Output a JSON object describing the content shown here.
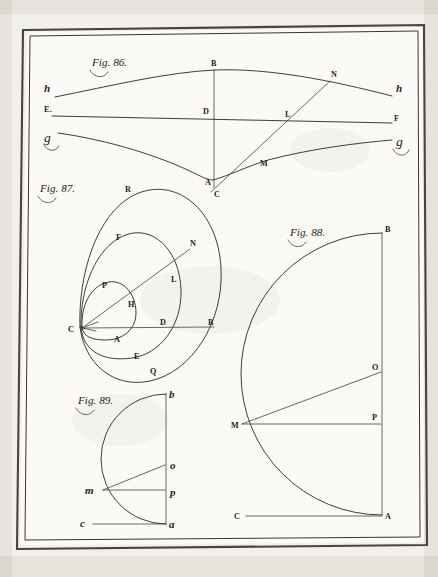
{
  "plate": {
    "title": "Engraved geometrical plate",
    "paper_color": "#f2f0ec",
    "field_color": "#fbfaf7",
    "ink_color": "#2b2724",
    "figure_count": 4
  },
  "figures": [
    {
      "id": "fig-86",
      "caption": "Fig. 86.",
      "description": "Three horizontal curves spanning the plate with a vertical axis B-D-A and an oblique line C-M-L-N.",
      "labels": [
        {
          "name": "h-left",
          "text": "h",
          "style": "italic",
          "x": 44,
          "y": 92
        },
        {
          "name": "E",
          "text": "E.",
          "style": "roman",
          "x": 44,
          "y": 110
        },
        {
          "name": "g-left",
          "text": "g",
          "style": "script",
          "x": 44,
          "y": 142
        },
        {
          "name": "B",
          "text": "B",
          "style": "roman",
          "x": 215,
          "y": 66
        },
        {
          "name": "D",
          "text": "D",
          "style": "roman",
          "x": 208,
          "y": 112
        },
        {
          "name": "A",
          "text": "A",
          "style": "roman",
          "x": 209,
          "y": 182
        },
        {
          "name": "C",
          "text": "C",
          "style": "roman",
          "x": 216,
          "y": 194
        },
        {
          "name": "M",
          "text": "M",
          "style": "roman",
          "x": 262,
          "y": 163
        },
        {
          "name": "L",
          "text": "L",
          "style": "roman",
          "x": 286,
          "y": 113
        },
        {
          "name": "N",
          "text": "N",
          "style": "roman",
          "x": 334,
          "y": 77
        },
        {
          "name": "F",
          "text": "F",
          "style": "roman",
          "x": 395,
          "y": 119
        },
        {
          "name": "h-right",
          "text": "h",
          "style": "italic",
          "x": 398,
          "y": 91
        },
        {
          "name": "g-right",
          "text": "g",
          "style": "script",
          "x": 400,
          "y": 146
        }
      ]
    },
    {
      "id": "fig-87",
      "caption": "Fig. 87.",
      "description": "Three nested limacon ovals sharing a common cusp at C, crossed by a horizontal ray C-A-D-B and an oblique ray C-H-L-N.",
      "labels": [
        {
          "name": "R",
          "text": "R",
          "style": "roman",
          "x": 127,
          "y": 190
        },
        {
          "name": "F",
          "text": "F",
          "style": "roman",
          "x": 118,
          "y": 238
        },
        {
          "name": "N",
          "text": "N",
          "style": "roman",
          "x": 189,
          "y": 244
        },
        {
          "name": "P",
          "text": "P",
          "style": "roman",
          "x": 104,
          "y": 286
        },
        {
          "name": "L",
          "text": "L",
          "style": "roman",
          "x": 172,
          "y": 280
        },
        {
          "name": "H",
          "text": "H",
          "style": "roman",
          "x": 129,
          "y": 305
        },
        {
          "name": "C",
          "text": "C",
          "style": "roman",
          "x": 72,
          "y": 330
        },
        {
          "name": "A",
          "text": "A",
          "style": "roman",
          "x": 117,
          "y": 340
        },
        {
          "name": "D",
          "text": "D",
          "style": "roman",
          "x": 163,
          "y": 324
        },
        {
          "name": "B",
          "text": "B",
          "style": "roman",
          "x": 210,
          "y": 324
        },
        {
          "name": "E",
          "text": "E",
          "style": "roman",
          "x": 136,
          "y": 356
        },
        {
          "name": "Q",
          "text": "Q",
          "style": "roman",
          "x": 152,
          "y": 372
        }
      ]
    },
    {
      "id": "fig-88",
      "caption": "Fig. 88.",
      "description": "Semicircular arc from B through M to A, vertical chord B-A, baseline C-A, and radii M-O and M-P.",
      "labels": [
        {
          "name": "B",
          "text": "B",
          "style": "roman",
          "x": 386,
          "y": 230
        },
        {
          "name": "O",
          "text": "O",
          "style": "roman",
          "x": 375,
          "y": 373
        },
        {
          "name": "P",
          "text": "P",
          "style": "roman",
          "x": 375,
          "y": 419
        },
        {
          "name": "M",
          "text": "M",
          "style": "roman",
          "x": 234,
          "y": 428
        },
        {
          "name": "C",
          "text": "C",
          "style": "roman",
          "x": 237,
          "y": 516
        },
        {
          "name": "A",
          "text": "A",
          "style": "roman",
          "x": 387,
          "y": 518
        }
      ]
    },
    {
      "id": "fig-89",
      "caption": "Fig. 89.",
      "description": "Smaller semicircular arc from b through m to a, vertical chord b-a, baseline c-a, and radii m-o and m-p; lettering in lower case.",
      "labels": [
        {
          "name": "b",
          "text": "b",
          "style": "italic",
          "x": 170,
          "y": 396
        },
        {
          "name": "o",
          "text": "o",
          "style": "italic",
          "x": 172,
          "y": 467
        },
        {
          "name": "p",
          "text": "p",
          "style": "italic",
          "x": 172,
          "y": 492
        },
        {
          "name": "m",
          "text": "m",
          "style": "italic",
          "x": 88,
          "y": 492
        },
        {
          "name": "c",
          "text": "c",
          "style": "italic",
          "x": 83,
          "y": 522
        },
        {
          "name": "a",
          "text": "a",
          "style": "italic",
          "x": 172,
          "y": 524
        }
      ]
    }
  ],
  "captions": {
    "fig86": {
      "text": "Fig. 86.",
      "x": 92,
      "y": 66
    },
    "fig87": {
      "text": "Fig. 87.",
      "x": 40,
      "y": 192
    },
    "fig88": {
      "text": "Fig. 88.",
      "x": 290,
      "y": 236
    },
    "fig89": {
      "text": "Fig. 89.",
      "x": 78,
      "y": 404
    }
  }
}
